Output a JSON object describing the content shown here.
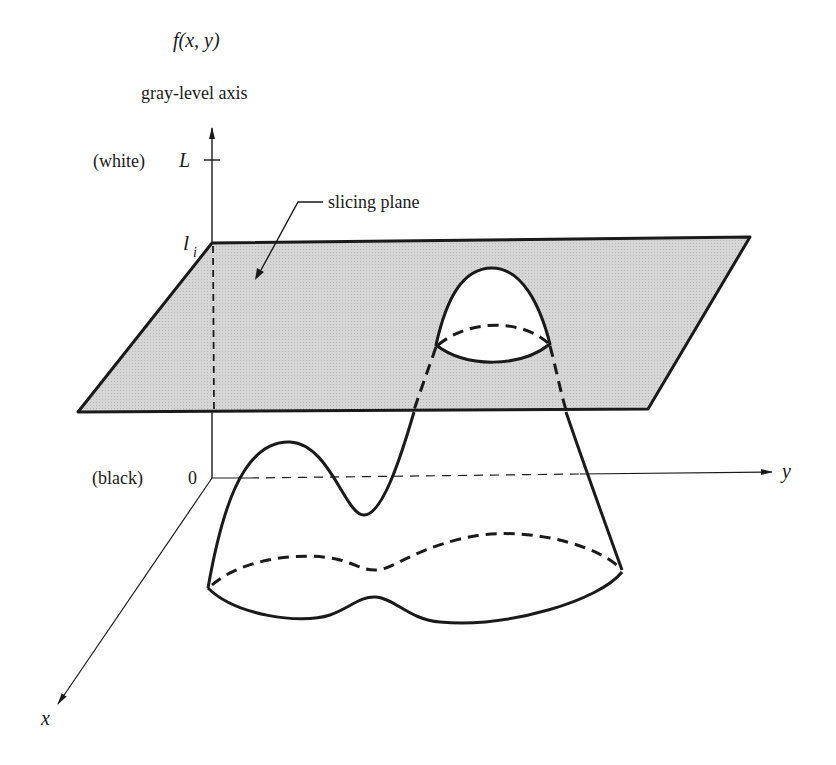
{
  "figure": {
    "function_label": "f(x, y)",
    "vertical_axis_label": "gray-level axis",
    "white_label": "(white)",
    "L_label": "L",
    "li_label": "l",
    "li_subscript": "i",
    "black_label": "(black)",
    "zero_label": "0",
    "y_axis_label": "y",
    "x_axis_label": "x",
    "slicing_plane_label": "slicing plane"
  },
  "colors": {
    "ink": "#1a1a1a",
    "plane_fill": "#d4d4d4",
    "background": "#ffffff"
  }
}
